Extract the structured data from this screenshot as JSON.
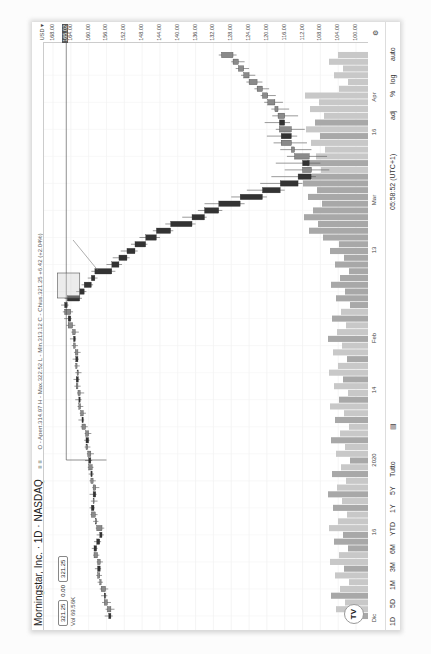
{
  "header": {
    "title": "Morningstar, Inc. · 1D · NASDAQ",
    "ohlc": "O - Apert.314.97  H - Max.322.52  L - Min.313.12  C - Chius.321.25  +6.42 (+2.04%)",
    "price_left": "321.25",
    "spread": "0.00",
    "price_right": "321.25",
    "volume": "Vol 69.56K",
    "indicator_icons": "≡ ≡"
  },
  "price_axis": {
    "currency": "USD ▾",
    "labels": [
      "168.00",
      "164.00",
      "160.00",
      "156.00",
      "152.00",
      "148.00",
      "144.00",
      "140.00",
      "136.00",
      "132.00",
      "128.00",
      "124.00",
      "120.00",
      "116.00",
      "112.00",
      "108.00",
      "104.00",
      "100.00"
    ],
    "highlight": "165.02",
    "highlight_color": "#555555"
  },
  "time_axis": {
    "labels": [
      "Dic",
      "16",
      "2020",
      "14",
      "Feb",
      "13",
      "Mar",
      "16",
      "Apr"
    ]
  },
  "toolbar": {
    "ranges": [
      "1D",
      "5D",
      "1M",
      "3M",
      "6M",
      "YTD",
      "1Y",
      "5Y",
      "Tutto"
    ],
    "clock": "05:58:52 (UTC+1)",
    "options": [
      "adj",
      "%",
      "log",
      "auto"
    ]
  },
  "markers": {
    "dividend": "D",
    "earnings": "E",
    "logo": "TV"
  },
  "chart_data": {
    "type": "candlestick",
    "title": "Morningstar, Inc. · 1D · NASDAQ",
    "xlabel": "",
    "ylabel": "Price (USD)",
    "ylim": [
      98,
      170
    ],
    "x_ticks": [
      "Dic",
      "16",
      "2020",
      "14",
      "Feb",
      "13",
      "Mar",
      "16",
      "Apr"
    ],
    "grid": true,
    "candles": [
      [
        155.5,
        156.4,
        154.6,
        155.0
      ],
      [
        155.0,
        156.2,
        154.2,
        155.8
      ],
      [
        155.8,
        157.0,
        155.0,
        156.5
      ],
      [
        156.5,
        157.2,
        155.8,
        156.2
      ],
      [
        156.2,
        157.5,
        155.6,
        157.2
      ],
      [
        157.2,
        158.0,
        156.8,
        157.5
      ],
      [
        157.5,
        158.3,
        157.0,
        158.0
      ],
      [
        158.0,
        158.6,
        157.2,
        157.4
      ],
      [
        157.4,
        158.2,
        156.8,
        158.0
      ],
      [
        158.0,
        159.0,
        157.6,
        158.8
      ],
      [
        158.8,
        159.3,
        158.0,
        158.2
      ],
      [
        158.2,
        158.8,
        157.2,
        157.5
      ],
      [
        157.5,
        158.2,
        156.6,
        157.0
      ],
      [
        157.0,
        158.4,
        156.5,
        158.2
      ],
      [
        158.2,
        159.0,
        157.8,
        158.5
      ],
      [
        158.5,
        159.6,
        158.0,
        159.4
      ],
      [
        159.4,
        159.8,
        158.6,
        158.8
      ],
      [
        158.8,
        159.5,
        158.0,
        159.0
      ],
      [
        159.0,
        159.8,
        158.2,
        158.4
      ],
      [
        158.4,
        159.2,
        157.6,
        159.0
      ],
      [
        159.0,
        159.8,
        158.4,
        159.5
      ],
      [
        159.5,
        160.0,
        158.8,
        159.2
      ],
      [
        159.2,
        160.2,
        158.9,
        160.0
      ],
      [
        160.0,
        160.8,
        159.2,
        159.5
      ],
      [
        159.5,
        160.4,
        158.8,
        160.2
      ],
      [
        160.2,
        160.9,
        159.6,
        160.6
      ],
      [
        160.6,
        161.0,
        159.8,
        160.0
      ],
      [
        160.0,
        160.9,
        159.4,
        160.7
      ],
      [
        160.7,
        161.8,
        160.2,
        161.5
      ],
      [
        161.5,
        162.3,
        161.0,
        161.2
      ],
      [
        161.2,
        162.0,
        160.6,
        161.8
      ],
      [
        161.8,
        162.5,
        161.2,
        162.2
      ],
      [
        162.2,
        163.0,
        161.6,
        161.9
      ],
      [
        161.9,
        162.6,
        161.0,
        162.4
      ],
      [
        162.4,
        163.2,
        161.8,
        162.8
      ],
      [
        162.8,
        163.4,
        162.0,
        162.3
      ],
      [
        162.3,
        163.0,
        161.6,
        162.6
      ],
      [
        162.6,
        163.2,
        162.0,
        162.9
      ],
      [
        162.9,
        163.6,
        162.2,
        162.4
      ],
      [
        162.4,
        163.3,
        161.8,
        163.0
      ],
      [
        163.0,
        163.8,
        162.4,
        163.4
      ],
      [
        163.4,
        164.2,
        162.8,
        163.0
      ],
      [
        163.0,
        163.9,
        162.2,
        163.6
      ],
      [
        163.6,
        165.0,
        163.0,
        164.6
      ],
      [
        164.6,
        165.5,
        163.8,
        164.0
      ],
      [
        164.0,
        165.8,
        163.5,
        165.4
      ],
      [
        165.4,
        166.2,
        164.5,
        164.8
      ],
      [
        164.8,
        165.4,
        161.5,
        162.0
      ],
      [
        162.0,
        162.8,
        160.5,
        161.0
      ],
      [
        161.0,
        161.6,
        159.0,
        159.4
      ],
      [
        159.4,
        160.2,
        158.0,
        158.6
      ],
      [
        158.6,
        159.4,
        154.0,
        154.8
      ],
      [
        154.8,
        156.0,
        152.5,
        153.2
      ],
      [
        153.2,
        154.6,
        150.8,
        151.4
      ],
      [
        151.4,
        152.8,
        149.0,
        149.6
      ],
      [
        149.6,
        150.5,
        146.8,
        147.2
      ],
      [
        147.2,
        148.6,
        144.0,
        144.8
      ],
      [
        144.8,
        145.6,
        141.0,
        141.6
      ],
      [
        141.6,
        142.8,
        136.0,
        136.8
      ],
      [
        136.8,
        139.0,
        133.5,
        134.0
      ],
      [
        134.0,
        135.5,
        130.0,
        130.8
      ],
      [
        130.8,
        134.0,
        125.0,
        126.0
      ],
      [
        126.0,
        128.0,
        120.0,
        121.0
      ],
      [
        121.0,
        124.5,
        116.0,
        117.0
      ],
      [
        117.0,
        121.5,
        112.0,
        113.0
      ],
      [
        113.0,
        119.0,
        109.0,
        110.0
      ],
      [
        110.0,
        116.0,
        106.0,
        112.0
      ],
      [
        112.0,
        118.0,
        108.0,
        110.5
      ],
      [
        110.5,
        115.5,
        106.5,
        113.8
      ],
      [
        113.8,
        117.0,
        110.0,
        114.5
      ],
      [
        114.5,
        118.5,
        111.0,
        116.8
      ],
      [
        116.8,
        120.0,
        113.2,
        114.5
      ],
      [
        114.5,
        118.0,
        111.5,
        117.2
      ],
      [
        117.2,
        120.5,
        114.8,
        116.0
      ],
      [
        116.0,
        118.8,
        113.0,
        117.5
      ],
      [
        117.5,
        119.0,
        115.0,
        118.2
      ],
      [
        118.2,
        120.6,
        116.4,
        119.8
      ],
      [
        119.8,
        121.4,
        118.0,
        121.0
      ],
      [
        121.0,
        122.8,
        119.5,
        122.2
      ],
      [
        122.2,
        124.6,
        121.0,
        124.0
      ],
      [
        124.0,
        125.8,
        122.6,
        125.2
      ],
      [
        125.2,
        127.0,
        124.0,
        126.4
      ],
      [
        126.4,
        128.0,
        125.0,
        127.6
      ],
      [
        127.6,
        130.8,
        126.8,
        130.2
      ]
    ]
  }
}
